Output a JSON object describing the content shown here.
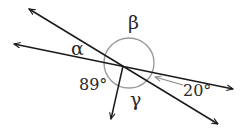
{
  "diagram": {
    "type": "intersecting-lines-angles",
    "colors": {
      "line": "#1a1a1a",
      "arc": "#9a9a9a",
      "text": "#2a2a2a",
      "background": "#ffffff"
    },
    "labels": {
      "alpha": "α",
      "beta": "β",
      "gamma": "γ",
      "angle_89": "89°",
      "angle_20": "20°"
    },
    "lines": [
      {
        "name": "steep-diagonal",
        "from": [
          29,
          9
        ],
        "to": [
          218,
          124
        ],
        "arrows": "both"
      },
      {
        "name": "shallow-diagonal",
        "from": [
          14,
          44
        ],
        "to": [
          233,
          89
        ],
        "arrows": "both"
      },
      {
        "name": "downward-ray",
        "from": [
          123,
          66
        ],
        "to": [
          111,
          119
        ],
        "arrows": "end"
      }
    ],
    "intersection": [
      123,
      66
    ],
    "angle_circle": {
      "center": [
        129,
        63
      ],
      "radius": 25
    },
    "given_angles": [
      {
        "label": "89°",
        "between": "shallow-diagonal (left) and downward-ray"
      },
      {
        "label": "20°",
        "between": "shallow-diagonal (right) and steep-diagonal (right)"
      }
    ],
    "unknown_angles": [
      "α",
      "β",
      "γ"
    ]
  }
}
